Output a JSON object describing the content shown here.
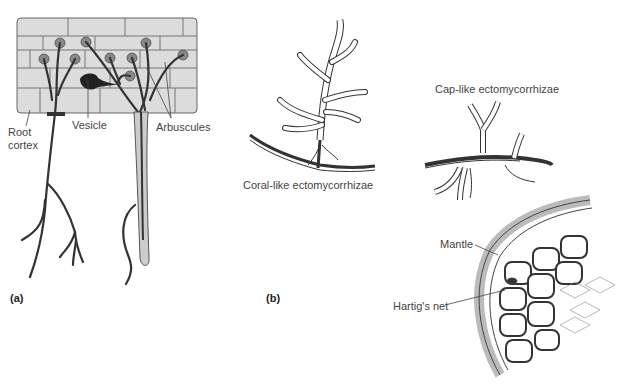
{
  "panels": {
    "a": {
      "label": "(a)",
      "title": "Arbuscular mycorrhizae",
      "callouts": {
        "root_cortex_line1": "Root",
        "root_cortex_line2": "cortex",
        "vesicle": "Vesicle",
        "arbuscules": "Arbuscules"
      }
    },
    "b": {
      "label": "(b)",
      "callouts": {
        "coral_like": "Coral-like ectomycorrhizae",
        "cap_like": "Cap-like ectomycorrhizae",
        "mantle": "Mantle",
        "hartigs_net": "Hartig's net"
      }
    }
  },
  "colors": {
    "cell_fill": "#d9d9d9",
    "cell_line": "#555555",
    "hypha": "#333333",
    "root_hair_fill": "#cccccc",
    "text": "#444444"
  }
}
